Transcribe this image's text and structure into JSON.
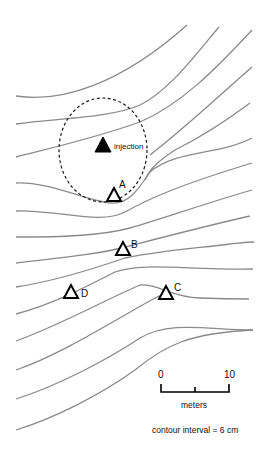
{
  "map": {
    "contour_color": "#8a8a8a",
    "contour_count": 17,
    "injection": {
      "label": "injection",
      "x": 103,
      "y": 148
    },
    "wells": [
      {
        "id": "A",
        "label": "A",
        "x": 114,
        "y": 196
      },
      {
        "id": "B",
        "label": "B",
        "x": 123,
        "y": 249
      },
      {
        "id": "C",
        "label": "C",
        "x": 166,
        "y": 293
      },
      {
        "id": "D",
        "label": "D",
        "x": 70,
        "y": 292
      }
    ]
  },
  "scale_bar": {
    "start_label": "0",
    "end_label": "10",
    "units": "meters"
  },
  "legend": {
    "contour_interval": "contour interval = 6 cm"
  }
}
